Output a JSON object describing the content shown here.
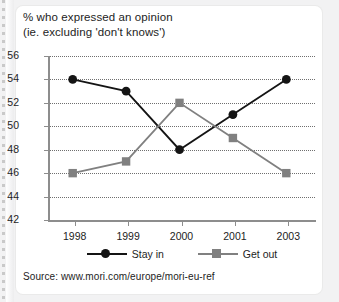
{
  "chart_data": {
    "type": "line",
    "title": "% who expressed an opinion",
    "subtitle": "(ie. excluding 'don't knows')",
    "xlabel": "",
    "ylabel": "",
    "categories": [
      "1998",
      "1999",
      "2000",
      "2001",
      "2003"
    ],
    "ylim": [
      42,
      56
    ],
    "y_ticks": [
      "42",
      "44",
      "46",
      "48",
      "50",
      "52",
      "54",
      "56"
    ],
    "grid": true,
    "legend_position": "bottom",
    "series": [
      {
        "name": "Stay in",
        "color": "#141414",
        "marker": "circle",
        "values": [
          54,
          53,
          48,
          51,
          54
        ]
      },
      {
        "name": "Get out",
        "color": "#808080",
        "marker": "square",
        "values": [
          46,
          47,
          52,
          49,
          46
        ]
      }
    ],
    "source": "Source: www.mori.com/europe/mori-eu-ref"
  }
}
